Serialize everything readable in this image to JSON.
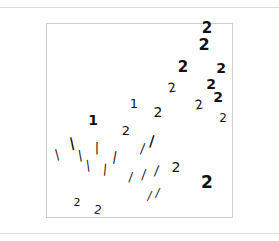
{
  "figure": {
    "description": "2D embedding of handwritten digit images (1s and 2s)",
    "frame": {
      "left": 46,
      "top": 23,
      "width": 187,
      "height": 195,
      "border_color": "#d0d0d0"
    },
    "rule_color": "#dcdcdc",
    "ink_color": "#111111"
  },
  "chart_data": {
    "type": "scatter",
    "title": "",
    "xlabel": "",
    "ylabel": "",
    "grid": false,
    "legend": "none",
    "marker": "digit-image",
    "series": [
      {
        "name": "digit 2",
        "points": [
          {
            "label": "2",
            "x": 207,
            "y": 33,
            "size": 15,
            "rot": 0,
            "weight": "bold"
          },
          {
            "label": "2",
            "x": 204,
            "y": 50,
            "size": 16,
            "rot": 0,
            "weight": "bold"
          },
          {
            "label": "2",
            "x": 183,
            "y": 72,
            "size": 15,
            "rot": 0,
            "weight": "bold"
          },
          {
            "label": "2",
            "x": 221,
            "y": 73,
            "size": 14,
            "rot": 0,
            "weight": "bold"
          },
          {
            "label": "2",
            "x": 172,
            "y": 92,
            "size": 13,
            "rot": -10,
            "weight": "normal"
          },
          {
            "label": "2",
            "x": 211,
            "y": 89,
            "size": 14,
            "rot": 0,
            "weight": "bold"
          },
          {
            "label": "2",
            "x": 218,
            "y": 102,
            "size": 14,
            "rot": 0,
            "weight": "bold"
          },
          {
            "label": "2",
            "x": 199,
            "y": 109,
            "size": 13,
            "rot": -10,
            "weight": "normal"
          },
          {
            "label": "2",
            "x": 223,
            "y": 122,
            "size": 12,
            "rot": 0,
            "weight": "normal"
          },
          {
            "label": "2",
            "x": 158,
            "y": 117,
            "size": 14,
            "rot": 0,
            "weight": "normal"
          },
          {
            "label": "2",
            "x": 126,
            "y": 135,
            "size": 13,
            "rot": 0,
            "weight": "normal"
          },
          {
            "label": "2",
            "x": 176,
            "y": 172,
            "size": 14,
            "rot": 0,
            "weight": "normal"
          },
          {
            "label": "2",
            "x": 207,
            "y": 188,
            "size": 17,
            "rot": 0,
            "weight": "bold"
          },
          {
            "label": "2",
            "x": 77,
            "y": 206,
            "size": 11,
            "rot": 0,
            "weight": "normal"
          },
          {
            "label": "2",
            "x": 98,
            "y": 214,
            "size": 12,
            "rot": 10,
            "weight": "normal"
          }
        ]
      },
      {
        "name": "digit 1",
        "points": [
          {
            "label": "1",
            "x": 93,
            "y": 125,
            "size": 14,
            "rot": 0,
            "weight": "bold"
          },
          {
            "label": "1",
            "x": 134,
            "y": 108,
            "size": 13,
            "rot": 0,
            "weight": "normal"
          },
          {
            "label": "|",
            "x": 72,
            "y": 147,
            "size": 13,
            "rot": -12,
            "weight": "bold"
          },
          {
            "label": "|",
            "x": 57,
            "y": 158,
            "size": 12,
            "rot": -15,
            "weight": "normal"
          },
          {
            "label": "|",
            "x": 80,
            "y": 159,
            "size": 12,
            "rot": -10,
            "weight": "normal"
          },
          {
            "label": "|",
            "x": 97,
            "y": 152,
            "size": 13,
            "rot": 0,
            "weight": "normal"
          },
          {
            "label": "|",
            "x": 88,
            "y": 169,
            "size": 12,
            "rot": -8,
            "weight": "normal"
          },
          {
            "label": "|",
            "x": 105,
            "y": 173,
            "size": 12,
            "rot": 5,
            "weight": "normal"
          },
          {
            "label": "|",
            "x": 115,
            "y": 161,
            "size": 13,
            "rot": 10,
            "weight": "normal"
          },
          {
            "label": "|",
            "x": 143,
            "y": 152,
            "size": 12,
            "rot": 22,
            "weight": "normal"
          },
          {
            "label": "|",
            "x": 152,
            "y": 145,
            "size": 13,
            "rot": 18,
            "weight": "bold"
          },
          {
            "label": "|",
            "x": 131,
            "y": 180,
            "size": 11,
            "rot": 20,
            "weight": "normal"
          },
          {
            "label": "|",
            "x": 144,
            "y": 178,
            "size": 12,
            "rot": 20,
            "weight": "normal"
          },
          {
            "label": "|",
            "x": 157,
            "y": 174,
            "size": 12,
            "rot": 22,
            "weight": "normal"
          },
          {
            "label": "|",
            "x": 150,
            "y": 199,
            "size": 11,
            "rot": 25,
            "weight": "normal"
          },
          {
            "label": "|",
            "x": 158,
            "y": 196,
            "size": 11,
            "rot": 25,
            "weight": "normal"
          }
        ]
      }
    ],
    "coordinate_space": "screenshot pixels (embedding axes unlabeled)"
  }
}
